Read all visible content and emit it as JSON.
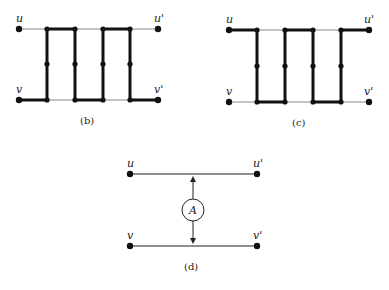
{
  "panels": {
    "b": {
      "caption": "(b)",
      "labels": {
        "u": "u",
        "u_prime": "u'",
        "v": "v",
        "v_prime": "v'"
      }
    },
    "c": {
      "caption": "(c)",
      "labels": {
        "u": "u",
        "u_prime": "u'",
        "v": "v",
        "v_prime": "v'"
      }
    },
    "d": {
      "caption": "(d)",
      "labels": {
        "u": "u",
        "u_prime": "u'",
        "v": "v",
        "v_prime": "v'"
      },
      "circle_label": "A"
    }
  },
  "colors": {
    "line": "#111111",
    "thin_line": "#777777"
  }
}
